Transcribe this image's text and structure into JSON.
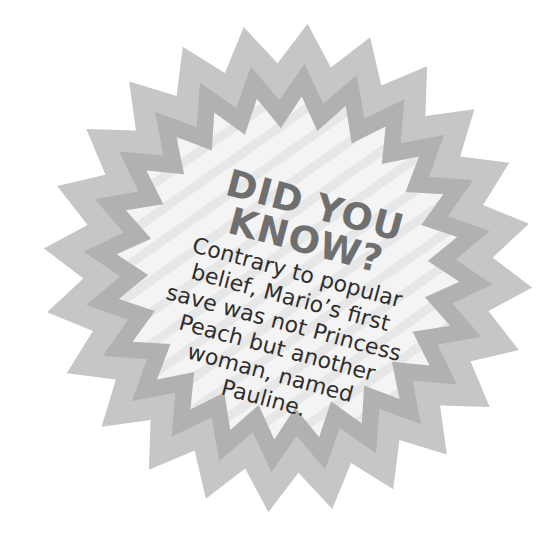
{
  "badge": {
    "shape": "starburst",
    "colors": {
      "outer_ring": "#c6c6c6",
      "middle_ring": "#b1b1b1",
      "center": "#f3f3f3",
      "stripe": "#e6e6e6",
      "heading": "#6f6f6f",
      "body": "#2e2e2e"
    },
    "heading_lines": [
      "DID YOU",
      "KNOW?"
    ],
    "body_lines": [
      "Contrary to popular",
      "belief, Mario’s first",
      "save was not Princess",
      "Peach but another",
      "woman, named",
      "Pauline."
    ]
  }
}
